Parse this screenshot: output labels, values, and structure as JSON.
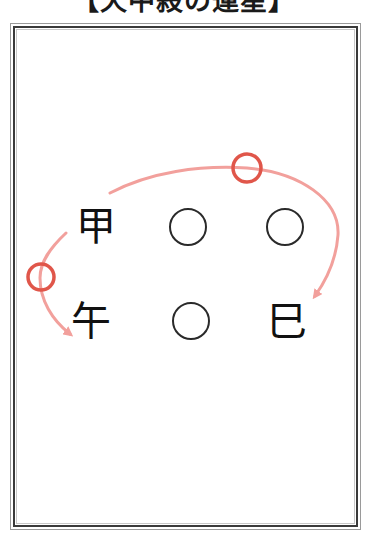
{
  "title": "【天中殺の運星】",
  "grid": {
    "rows": [
      {
        "cells": [
          {
            "type": "char",
            "value": "甲"
          },
          {
            "type": "circle",
            "value": "○"
          },
          {
            "type": "circle",
            "value": "○"
          }
        ]
      },
      {
        "cells": [
          {
            "type": "char",
            "value": "午"
          },
          {
            "type": "circle",
            "value": "○"
          },
          {
            "type": "char",
            "value": "巳"
          }
        ]
      }
    ]
  },
  "annotations": {
    "arrows": [
      {
        "name": "arc-top-to-bottom-right",
        "from": "甲",
        "to": "巳",
        "direction": "clockwise-over-top"
      },
      {
        "name": "arc-left-to-bottom-left",
        "from": "甲",
        "to": "午",
        "direction": "down-left-side"
      }
    ],
    "markers": [
      {
        "name": "red-circle-top",
        "shape": "circle"
      },
      {
        "name": "red-circle-left",
        "shape": "circle"
      }
    ]
  },
  "colors": {
    "arrow": "#f2a09c",
    "marker": "#e0564a",
    "text": "#111111",
    "frame": "#3a3a3a"
  }
}
